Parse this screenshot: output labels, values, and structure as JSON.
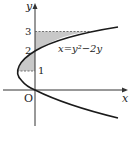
{
  "diagram": {
    "axes": {
      "x_label": "x",
      "y_label": "y",
      "origin_label": "O"
    },
    "tick_labels": {
      "y1": "1",
      "y2": "2",
      "y3": "3"
    },
    "curve_label": "x=y²−2y",
    "colors": {
      "curve": "#1a1a1a",
      "shade": "#c8c8c8",
      "axis": "#333333",
      "dash": "#555555"
    }
  }
}
